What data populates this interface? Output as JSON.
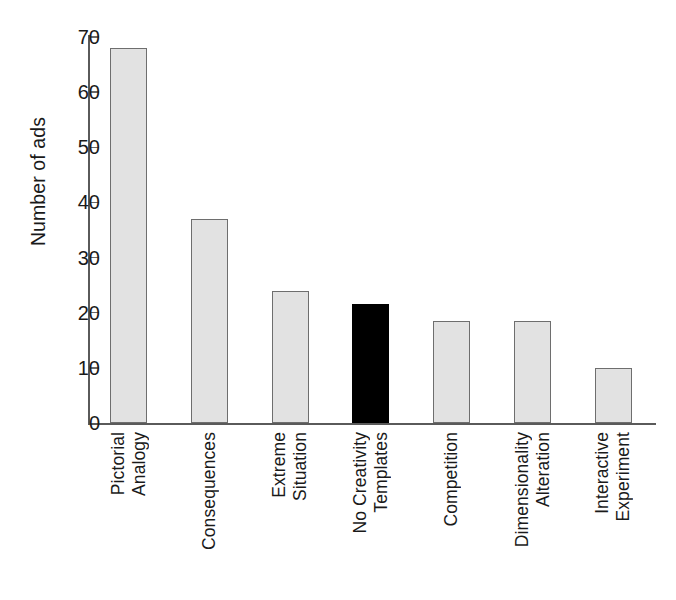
{
  "chart_data": {
    "type": "bar",
    "title": "",
    "xlabel": "",
    "ylabel": "Number of ads",
    "ylim": [
      0,
      70
    ],
    "yticks": [
      0,
      10,
      20,
      30,
      40,
      50,
      60,
      70
    ],
    "grid": false,
    "legend": "none",
    "categories": [
      "Pictorial Analogy",
      "Consequences",
      "Extreme Situation",
      "No Creativity Templates",
      "Competition",
      "Dimensionality Alteration",
      "Interactive Experiment"
    ],
    "category_lines": [
      [
        "Pictorial",
        "Analogy"
      ],
      [
        "Consequences"
      ],
      [
        "Extreme",
        "Situation"
      ],
      [
        "No Creativity",
        "Templates"
      ],
      [
        "Competition"
      ],
      [
        "Dimensionality",
        "Alteration"
      ],
      [
        "Interactive",
        "Experiment"
      ]
    ],
    "values": [
      68,
      37,
      24,
      21.5,
      18.5,
      18.5,
      10
    ],
    "highlight_index": 3,
    "colors": {
      "bar_fill": "#e2e2e2",
      "bar_border": "#6e6e6e",
      "highlight_fill": "#000000",
      "axis": "#5a5a5a",
      "text": "#1a1a1a",
      "background": "#ffffff"
    }
  }
}
